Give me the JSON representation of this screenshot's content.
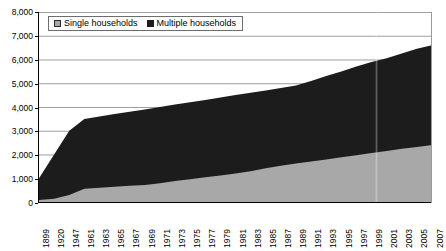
{
  "chart_data": {
    "type": "area",
    "stacked": true,
    "title": "",
    "subtitle": "",
    "xlabel": "",
    "ylabel": "",
    "ylim": [
      0,
      8000
    ],
    "ytick_step": 1000,
    "grid": true,
    "legend_position": "top-left",
    "ytick_labels": [
      "8,000",
      "7,000",
      "6,000",
      "5,000",
      "4,000",
      "3,000",
      "2,000",
      "1,000",
      "0"
    ],
    "ytick_values": [
      8000,
      7000,
      6000,
      5000,
      4000,
      3000,
      2000,
      1000,
      0
    ],
    "categories": [
      "1899",
      "1920",
      "1947",
      "1961",
      "1963",
      "1965",
      "1967",
      "1969",
      "1971",
      "1973",
      "1975",
      "1977",
      "1979",
      "1981",
      "1983",
      "1985",
      "1987",
      "1989",
      "1991",
      "1993",
      "1995",
      "1997",
      "1999",
      "2001",
      "2003",
      "2005",
      "2007"
    ],
    "series": [
      {
        "name": "Single households",
        "color": "#a8a8a8",
        "values": [
          80,
          140,
          290,
          560,
          600,
          640,
          680,
          720,
          790,
          880,
          960,
          1040,
          1120,
          1200,
          1290,
          1420,
          1530,
          1620,
          1700,
          1790,
          1880,
          1970,
          2060,
          2150,
          2240,
          2320,
          2400
        ]
      },
      {
        "name": "Multiple households",
        "color": "#1c1c1c",
        "values": [
          920,
          1860,
          2710,
          2940,
          3000,
          3060,
          3120,
          3180,
          3210,
          3220,
          3240,
          3260,
          3280,
          3300,
          3310,
          3280,
          3270,
          3280,
          3400,
          3510,
          3620,
          3730,
          3840,
          3900,
          4010,
          4130,
          4200
        ]
      }
    ],
    "totals": [
      1000,
      2000,
      3000,
      3500,
      3600,
      3700,
      3800,
      3900,
      4000,
      4100,
      4200,
      4300,
      4400,
      4500,
      4600,
      4700,
      4800,
      4900,
      5100,
      5300,
      5500,
      5700,
      5900,
      6050,
      6250,
      6450,
      6600
    ]
  },
  "legend": {
    "items": [
      {
        "label": "Single households",
        "swatch": "single-households-swatch"
      },
      {
        "label": "Multiple households",
        "swatch": "multiple-households-swatch"
      }
    ]
  }
}
